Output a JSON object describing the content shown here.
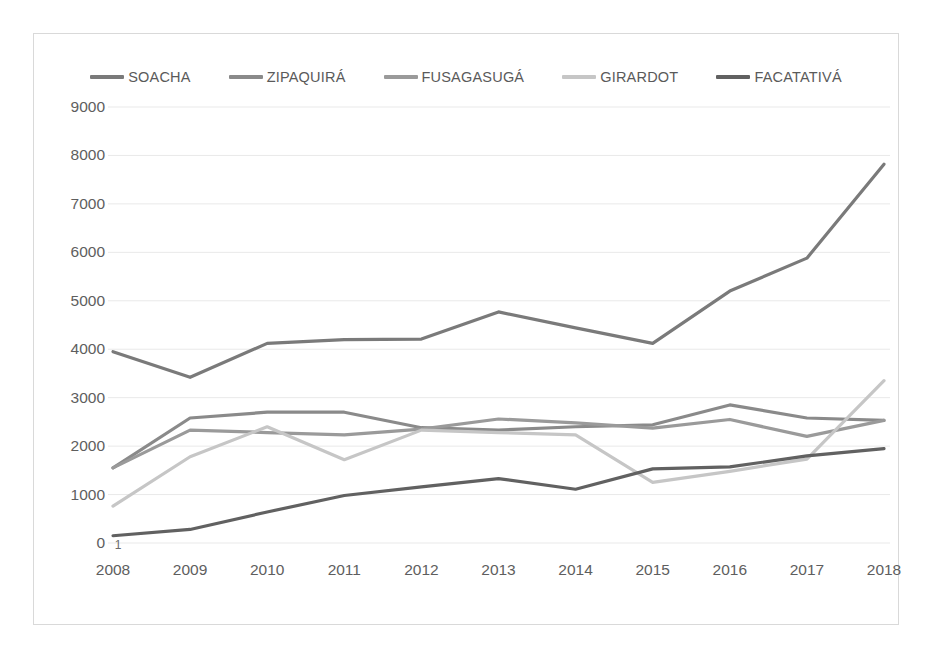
{
  "chart_data": {
    "type": "line",
    "title": "",
    "subtitle": "",
    "xlabel": "",
    "ylabel": "",
    "categories": [
      "2008",
      "2009",
      "2010",
      "2011",
      "2012",
      "2013",
      "2014",
      "2015",
      "2016",
      "2017",
      "2018"
    ],
    "ylim": [
      0,
      9000
    ],
    "ytick_values": [
      0,
      1000,
      2000,
      3000,
      4000,
      5000,
      6000,
      7000,
      8000,
      9000
    ],
    "ytick_labels": [
      "0",
      "1000",
      "2000",
      "3000",
      "4000",
      "5000",
      "6000",
      "7000",
      "8000",
      "9000"
    ],
    "grid": true,
    "grid_axis": "y",
    "legend_position": "top",
    "series": [
      {
        "name": "SOACHA",
        "color": "#7a7a7a",
        "values": [
          3950,
          3420,
          4120,
          4200,
          4210,
          4770,
          4440,
          4120,
          5200,
          5880,
          7820
        ]
      },
      {
        "name": "ZIPAQUIRÁ",
        "color": "#8a8a8a",
        "values": [
          1550,
          2580,
          2700,
          2700,
          2380,
          2330,
          2400,
          2440,
          2850,
          2580,
          2530
        ]
      },
      {
        "name": "FUSAGASUGÁ",
        "color": "#9a9a9a",
        "values": [
          1550,
          2330,
          2280,
          2230,
          2350,
          2560,
          2480,
          2370,
          2550,
          2200,
          2530
        ]
      },
      {
        "name": "GIRARDOT",
        "color": "#c6c6c6",
        "values": [
          760,
          1780,
          2400,
          1720,
          2330,
          2280,
          2230,
          1250,
          1480,
          1730,
          3350
        ]
      },
      {
        "name": "FACATATIVÁ",
        "color": "#616161",
        "values": [
          150,
          280,
          640,
          980,
          1160,
          1330,
          1110,
          1530,
          1570,
          1800,
          1950
        ]
      }
    ],
    "point_labels": [
      {
        "series": "FACATATIVÁ",
        "category": "2008",
        "text": "1"
      }
    ]
  },
  "legend": {
    "items": [
      {
        "label": "SOACHA"
      },
      {
        "label": "ZIPAQUIRÁ"
      },
      {
        "label": "FUSAGASUGÁ"
      },
      {
        "label": "GIRARDOT"
      },
      {
        "label": "FACATATIVÁ"
      }
    ]
  }
}
